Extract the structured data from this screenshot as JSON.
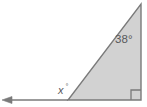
{
  "figure": {
    "kind": "geometry-diagram",
    "background_color": "#ffffff",
    "shape": {
      "name": "right-triangle",
      "fill_color": "#d2d2d2",
      "stroke_color": "#7a7a7a",
      "stroke_width": 1.4,
      "vertices": {
        "apex": [
          141,
          4
        ],
        "bottom_right": [
          141,
          100
        ],
        "bottom_left": [
          68,
          100
        ]
      }
    },
    "ray": {
      "name": "extended-base-ray",
      "stroke_color": "#7a7a7a",
      "stroke_width": 1.4,
      "from": [
        68,
        100
      ],
      "to": [
        5,
        100
      ],
      "arrow_head": "left",
      "arrow_tip": [
        2,
        100
      ]
    },
    "right_angle_marker": {
      "name": "right-angle-square",
      "corner": [
        141,
        100
      ],
      "size": 10,
      "stroke_color": "#7a7a7a",
      "measure": "90"
    },
    "labels": {
      "apex_angle": {
        "text": "38°",
        "value": "38",
        "unit": "degrees",
        "x": 115,
        "y": 43,
        "color": "#59595b"
      },
      "exterior_angle": {
        "variable": "x",
        "degree_symbol": "°",
        "text": "x°",
        "x": 58,
        "y": 94,
        "color": "#59595b"
      }
    }
  }
}
